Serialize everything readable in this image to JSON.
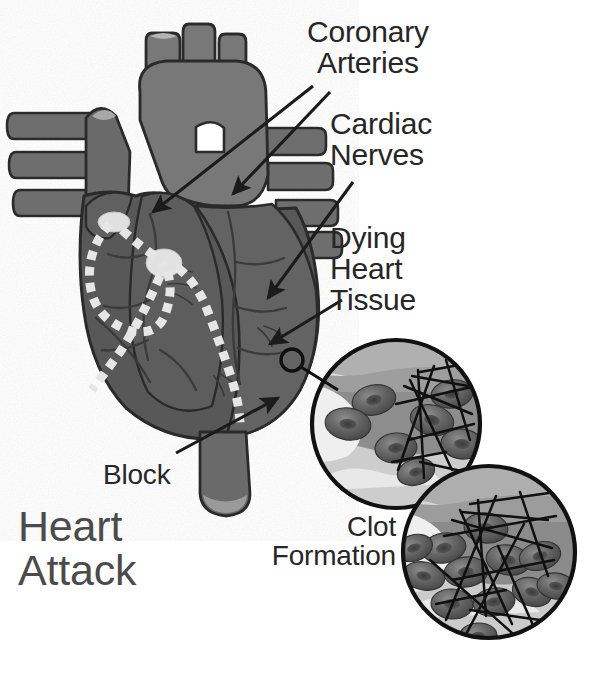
{
  "figure": {
    "title": "Heart Attack",
    "background_color": "#ffffff",
    "ink_color": "#262626",
    "title_color": "#4b4b4b"
  },
  "labels": {
    "coronary_arteries": "Coronary\nArteries",
    "cardiac_nerves": "Cardiac\nNerves",
    "dying_heart_tissue": "Dying\nHeart\nTissue",
    "block": "Block",
    "clot_formation": "Clot\nFormation",
    "heart_attack": "Heart\nAttack"
  },
  "anatomy": {
    "heart_body_color": "#585858",
    "heart_light_color": "#777777",
    "heart_mid_color": "#6a6a6a",
    "vessel_color": "#6e6e6e",
    "outline_color": "#2b2b2b",
    "conduction_dot_color": "#e3e3e3",
    "node_color": "#e0e0e0",
    "parts": [
      "aortic-arch",
      "brachiocephalic-trunk",
      "left-common-carotid-artery",
      "left-subclavian-artery",
      "superior-vena-cava",
      "pulmonary-veins-left",
      "pulmonary-veins-right",
      "pulmonary-trunk",
      "right-atrium",
      "left-ventricle",
      "right-ventricle",
      "inferior-vena-cava",
      "descending-aorta",
      "coronary-artery-branches",
      "sinoatrial-node",
      "atrioventricular-node",
      "conduction-pathway"
    ]
  },
  "insets": {
    "count": 2,
    "border_color": "#111111",
    "vessel_wall_color": "#a6a6a6",
    "lumen_color": "#828282",
    "plasma_color": "#d8d8d8",
    "rbc_color": "#545454",
    "rbc_highlight": "#7d7d7d",
    "fibrin_color": "#111111",
    "items": [
      {
        "id": "inset-partial-clot",
        "cx": 396,
        "cy": 424,
        "r": 84,
        "rbc_count": 7,
        "fibrin_strands": 11
      },
      {
        "id": "inset-full-clot",
        "cx": 489,
        "cy": 552,
        "r": 86,
        "rbc_count": 12,
        "fibrin_strands": 14
      }
    ]
  },
  "callouts": {
    "marker": {
      "id": "magnifier-origin-circle",
      "cx": 292,
      "cy": 360,
      "r": 11
    },
    "leader_line": {
      "from": [
        301,
        368
      ],
      "to": [
        336,
        388
      ]
    },
    "arrows": [
      {
        "id": "arrow-coronary-left",
        "from": [
          313,
          86
        ],
        "to": [
          151,
          214
        ]
      },
      {
        "id": "arrow-coronary-right",
        "from": [
          330,
          92
        ],
        "to": [
          232,
          196
        ]
      },
      {
        "id": "arrow-cardiac-nerves",
        "from": [
          352,
          182
        ],
        "to": [
          267,
          300
        ]
      },
      {
        "id": "arrow-dying-tissue",
        "from": [
          341,
          300
        ],
        "to": [
          268,
          346
        ]
      },
      {
        "id": "arrow-block",
        "from": [
          178,
          452
        ],
        "to": [
          277,
          399
        ]
      }
    ]
  }
}
